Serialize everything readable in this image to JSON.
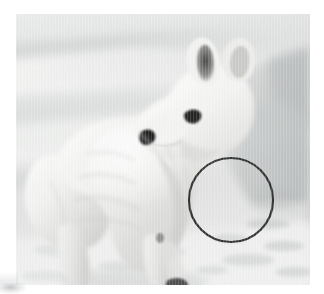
{
  "image": {
    "kind": "photograph",
    "subject": "arctic-fox",
    "scene_description": "An Arctic fox in full white winter coat stands in profile on a snowfield, head turned to the right, against pale snow drifts.",
    "palette": {
      "page_background": "#ffffff",
      "snow_highlight": "#f2f2f0",
      "snow_light": "#e4e5e4",
      "snow_mid": "#d2d4d4",
      "snow_shadow": "#b9bcbd",
      "snow_deep_shadow": "#a6aaab",
      "fur_highlight": "#fbfbfa",
      "fur_light": "#eeeeec",
      "fur_shade": "#d8d9d7",
      "fur_deep_shade": "#c2c3c1",
      "nose_black": "#171717",
      "eye_black": "#1d1d1d",
      "ear_dark": "#3a3a39",
      "paw_dark": "#2e2e2e",
      "annotation_stroke": "#2b2b2b"
    },
    "frame": {
      "left": 16,
      "top": 14,
      "width": 294,
      "height": 271
    }
  },
  "annotation": {
    "type": "circle",
    "label": "region-of-interest-circle",
    "stroke_color": "#2b2b2b",
    "stroke_width": 2.2,
    "fill": "none",
    "center_x": 215,
    "center_y": 186,
    "radius": 42
  },
  "subject_parts": [
    {
      "name": "head",
      "description": "white fox head turned right"
    },
    {
      "name": "ear-left",
      "description": "upright ear with dark grey inner shadow"
    },
    {
      "name": "ear-right",
      "description": "upright ear, rear, pale"
    },
    {
      "name": "eye",
      "description": "small dark almond eye"
    },
    {
      "name": "nose",
      "description": "black triangular nose tip"
    },
    {
      "name": "muzzle",
      "description": "short white snout"
    },
    {
      "name": "neck-ruff",
      "description": "thick white neck fur"
    },
    {
      "name": "body",
      "description": "dense white winter coat torso"
    },
    {
      "name": "foreleg",
      "description": "front leg reaching down to snow"
    },
    {
      "name": "hindleg",
      "description": "rear leg in shadow"
    },
    {
      "name": "paw",
      "description": "dark front paw on snow"
    }
  ],
  "background_elements": [
    {
      "name": "snow-drift-band-upper",
      "description": "horizontal pale snow drift band across upper third"
    },
    {
      "name": "snow-drift-band-middle",
      "description": "soft mid-tone snow ridge"
    },
    {
      "name": "snow-shadow-right",
      "description": "grey shadowed snow bank at right edge"
    },
    {
      "name": "snow-foreground",
      "description": "bright foreground snow with shallow tracks"
    },
    {
      "name": "snow-track-marks",
      "description": "shallow grey depressions in foreground snow"
    }
  ]
}
